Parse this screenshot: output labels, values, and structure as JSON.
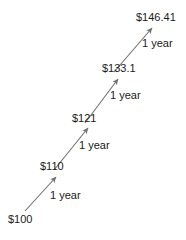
{
  "diagram": {
    "type": "compound-growth-arrow-chain",
    "background_color": "#ffffff",
    "line_color": "#707070",
    "text_color": "#1a1a1a",
    "nodes": [
      {
        "label": "$100",
        "x": 8,
        "y": 213
      },
      {
        "label": "$110",
        "x": 40,
        "y": 160
      },
      {
        "label": "$121",
        "x": 72,
        "y": 112
      },
      {
        "label": "$133.1",
        "x": 102,
        "y": 62
      },
      {
        "label": "$146.41",
        "x": 136,
        "y": 11
      }
    ],
    "edges": [
      {
        "label": "1 year",
        "x": 50,
        "y": 189,
        "x1": 25,
        "y1": 211,
        "x2": 56,
        "y2": 177
      },
      {
        "label": "1 year",
        "x": 79,
        "y": 139,
        "x2": 88,
        "y2": 128,
        "x1": 54,
        "y1": 170
      },
      {
        "label": "1 year",
        "x": 110,
        "y": 89,
        "x1": 85,
        "y1": 123,
        "x2": 118,
        "y2": 79
      },
      {
        "label": "1 year",
        "x": 142,
        "y": 37,
        "x1": 114,
        "y1": 72,
        "x2": 152,
        "y2": 28
      }
    ]
  },
  "chart_data": {
    "type": "line",
    "title": "",
    "xlabel": "",
    "ylabel": "",
    "categories": [
      "Year 0",
      "Year 1",
      "Year 2",
      "Year 3",
      "Year 4"
    ],
    "values": [
      100,
      110,
      121,
      133.1,
      146.41
    ],
    "value_labels": [
      "$100",
      "$110",
      "$121",
      "$133.1",
      "$146.41"
    ],
    "step_labels": [
      "1 year",
      "1 year",
      "1 year",
      "1 year"
    ]
  }
}
